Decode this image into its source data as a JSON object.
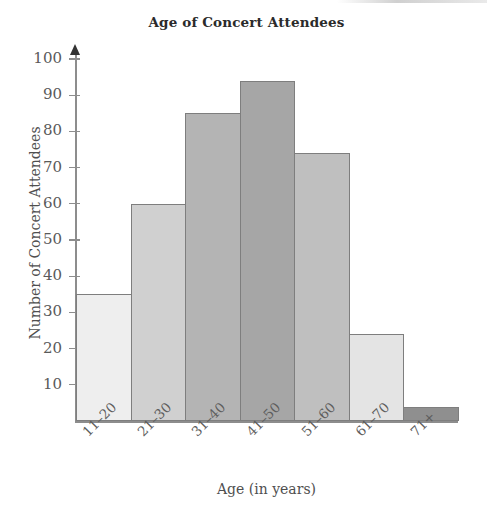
{
  "chart_data": {
    "type": "bar",
    "title": "Age of Concert Attendees",
    "xlabel": "Age (in years)",
    "ylabel": "Number of Concert Attendees",
    "categories": [
      "11–20",
      "21–30",
      "31–40",
      "41–50",
      "51–60",
      "61–70",
      "71+"
    ],
    "values": [
      35,
      60,
      85,
      94,
      74,
      24,
      4
    ],
    "ylim": [
      0,
      100
    ],
    "xlim_note": "categorical, 7 adjacent bins",
    "yticks": [
      10,
      20,
      30,
      40,
      50,
      60,
      70,
      80,
      90,
      100
    ],
    "ytick_labels": [
      "10",
      "20",
      "30",
      "40",
      "50",
      "60",
      "70",
      "80",
      "90",
      "100"
    ],
    "grid": false,
    "legend": "none",
    "bar_colors": [
      "#eeeeee",
      "#d0d0d0",
      "#b4b4b4",
      "#a6a6a6",
      "#bfbfbf",
      "#e4e4e4",
      "#8f8f8f"
    ],
    "bar_edge_color": "#7e7e7e",
    "axis_color": "#8d8d8d",
    "text_color": "#4f4f4f",
    "background": "#ffffff",
    "y_axis_arrow": true,
    "xtick_label_rotation": -45
  },
  "figure": {
    "title": "Age of Concert Attendees",
    "x_axis_title": "Age (in years)",
    "y_axis_title": "Number of Concert Attendees"
  }
}
